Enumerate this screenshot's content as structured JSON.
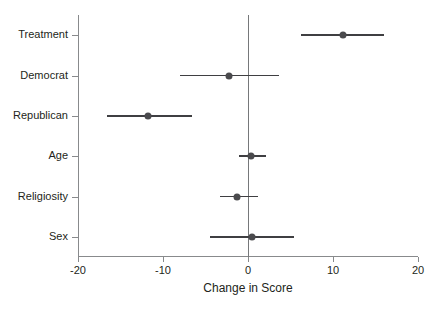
{
  "chart_data": {
    "type": "scatter",
    "subtype": "coefficient-plot-with-error-bars",
    "title": "",
    "xlabel": "Change in Score",
    "ylabel": "",
    "xlim": [
      -20,
      20
    ],
    "xticks": [
      -20,
      -10,
      0,
      10,
      20
    ],
    "xtick_labels": [
      "-20",
      "-10",
      "0",
      "10",
      "20"
    ],
    "grid": false,
    "legend": null,
    "reference_line": {
      "x": 0,
      "orientation": "vertical"
    },
    "categories": [
      "Treatment",
      "Democrat",
      "Republican",
      "Age",
      "Religiosity",
      "Sex"
    ],
    "values": [
      11.2,
      -2.2,
      -11.8,
      0.4,
      -1.3,
      0.5
    ],
    "ci_low": [
      6.2,
      -8.0,
      -16.6,
      -1.1,
      -3.3,
      -4.5
    ],
    "ci_high": [
      16.0,
      3.7,
      -6.6,
      2.1,
      1.2,
      5.4
    ],
    "points": [
      {
        "label": "Treatment",
        "estimate": 11.2,
        "ci_low": 6.2,
        "ci_high": 16.0
      },
      {
        "label": "Democrat",
        "estimate": -2.2,
        "ci_low": -8.0,
        "ci_high": 3.7
      },
      {
        "label": "Republican",
        "estimate": -11.8,
        "ci_low": -16.6,
        "ci_high": -6.6
      },
      {
        "label": "Age",
        "estimate": 0.4,
        "ci_low": -1.1,
        "ci_high": 2.1
      },
      {
        "label": "Religiosity",
        "estimate": -1.3,
        "ci_low": -3.3,
        "ci_high": 1.2
      },
      {
        "label": "Sex",
        "estimate": 0.5,
        "ci_low": -4.5,
        "ci_high": 5.4
      }
    ],
    "colors": {
      "point": "#4a4a4d",
      "ci": "#3f3f42",
      "axis": "#888a8c",
      "zero_line": "#76787a",
      "text": "#231f20",
      "background": "#ffffff"
    }
  }
}
